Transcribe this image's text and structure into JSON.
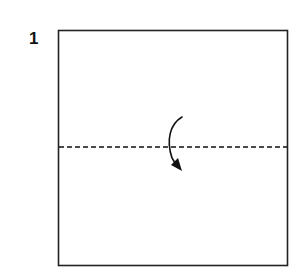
{
  "step": {
    "number": "1"
  },
  "diagram": {
    "paper": {
      "x": 58,
      "y": 30,
      "width": 230,
      "height": 236,
      "stroke": "#222222"
    },
    "fold_line": {
      "type": "valley-fold",
      "y": 147,
      "dash": "5,3"
    },
    "arrow": {
      "direction": "fold-down",
      "color": "#111111"
    }
  }
}
